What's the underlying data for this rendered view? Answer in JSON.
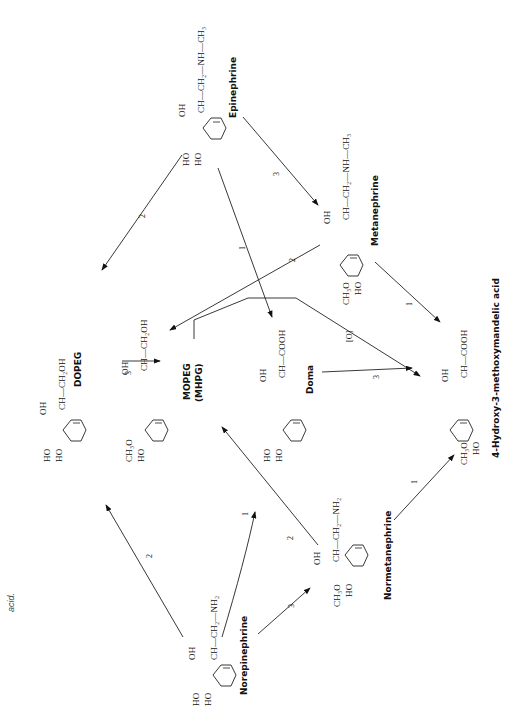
{
  "caption_fragment": "acid.",
  "compounds": {
    "norepinephrine": {
      "name": "Norepinephrine",
      "sidechain": "OH | CH—CH₂—NH₂",
      "ring_subs": [
        "HO",
        "HO"
      ]
    },
    "epinephrine": {
      "name": "Epinephrine",
      "sidechain": "CH—CH₂—NH—CH₃",
      "oh": "OH",
      "ring_subs": [
        "HO",
        "HO"
      ]
    },
    "dopeg": {
      "name": "DOPEG",
      "sidechain": "CH—CH₂OH",
      "oh": "OH",
      "ring_subs": [
        "HO",
        "HO"
      ]
    },
    "mopeg": {
      "name": "MOPEG",
      "alt_name": "(MHPG)",
      "sidechain": "CH—CH₂OH",
      "oh": "OH",
      "ring_subs": [
        "CH₃O",
        "HO"
      ]
    },
    "doma": {
      "name": "Doma",
      "sidechain": "CH—COOH",
      "oh": "OH",
      "ring_subs": [
        "HO",
        "HO"
      ]
    },
    "metanephrine": {
      "name": "Metanephrine",
      "sidechain": "CH—CH₂—NH—CH₃",
      "oh": "OH",
      "ring_subs": [
        "CH₃O",
        "HO"
      ]
    },
    "normetanephrine": {
      "name": "Normetanephrine",
      "sidechain": "CH—CH₂—NH₂",
      "oh": "OH",
      "ring_subs": [
        "CH₃O",
        "HO"
      ]
    },
    "vma": {
      "name": "4-Hydroxy-3-methoxymandelic acid",
      "sidechain": "CH—COOH",
      "oh": "OH",
      "ring_subs": [
        "CH₃O",
        "HO"
      ]
    }
  },
  "norepinephrine_oh": "OH",
  "norepinephrine_chain": "CH—CH₂—NH₂",
  "arrows": [
    {
      "from": "norepinephrine",
      "to": "dopeg",
      "label": "2"
    },
    {
      "from": "norepinephrine",
      "to": "doma",
      "label": "1"
    },
    {
      "from": "norepinephrine",
      "to": "normetanephrine",
      "label": "3"
    },
    {
      "from": "epinephrine",
      "to": "dopeg",
      "label": "2"
    },
    {
      "from": "epinephrine",
      "to": "doma",
      "label": "1"
    },
    {
      "from": "epinephrine",
      "to": "metanephrine",
      "label": "3"
    },
    {
      "from": "dopeg",
      "to": "mopeg",
      "label": "3"
    },
    {
      "from": "normetanephrine",
      "to": "mopeg",
      "label": "2"
    },
    {
      "from": "metanephrine",
      "to": "mopeg",
      "label": "2"
    },
    {
      "from": "doma",
      "to": "vma",
      "label": "3"
    },
    {
      "from": "mopeg",
      "to": "vma",
      "label": "[O]"
    },
    {
      "from": "metanephrine",
      "to": "vma",
      "label": "1"
    },
    {
      "from": "normetanephrine",
      "to": "vma",
      "label": "1"
    }
  ]
}
